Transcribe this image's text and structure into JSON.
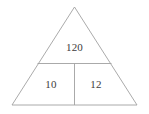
{
  "figure": {
    "type": "geometry-diagram",
    "shape_name": "triangle",
    "background_color": "#ffffff",
    "line_color": "#a0a0a0",
    "line_width": 0.8,
    "text_color": "#3d3d3d",
    "canvas": {
      "width": 149,
      "height": 114
    },
    "vertices": {
      "apex": {
        "x": 74.5,
        "y": 7
      },
      "bottom_left": {
        "x": 12,
        "y": 105
      },
      "bottom_right": {
        "x": 137,
        "y": 105
      }
    },
    "dividers": [
      {
        "name": "horizontal-divider",
        "orientation": "horizontal",
        "x1": 37.5,
        "y1": 63.5,
        "x2": 111.5,
        "y2": 63.5
      },
      {
        "name": "vertical-divider",
        "orientation": "vertical",
        "x1": 74.5,
        "y1": 63.5,
        "x2": 74.5,
        "y2": 105
      }
    ],
    "regions": [
      {
        "name": "top-region",
        "label": "120",
        "x": 74.5,
        "y": 47
      },
      {
        "name": "bottom-left-region",
        "label": "10",
        "x": 51,
        "y": 84
      },
      {
        "name": "bottom-right-region",
        "label": "12",
        "x": 96,
        "y": 84
      }
    ]
  }
}
